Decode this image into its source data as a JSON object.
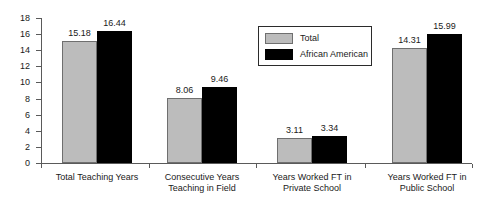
{
  "chart_data": {
    "type": "bar",
    "title": "",
    "xlabel": "",
    "ylabel": "",
    "ylim": [
      0,
      18
    ],
    "ytick_step": 2,
    "grid": false,
    "legend_position": "top-center",
    "categories": [
      "Total Teaching Years",
      "Consecutive Years\nTeaching in Field",
      "Years Worked FT in\nPrivate School",
      "Years Worked FT in\nPublic School"
    ],
    "ytick_labels": [
      "18",
      "16",
      "14",
      "12",
      "10",
      "8",
      "6",
      "4",
      "2",
      "0"
    ],
    "series": [
      {
        "name": "Total",
        "color": "#bcbcbc",
        "values": [
          15.18,
          8.06,
          3.11,
          14.31
        ],
        "value_labels": [
          "15.18",
          "8.06",
          "3.11",
          "14.31"
        ]
      },
      {
        "name": "African American",
        "color": "#000000",
        "values": [
          16.44,
          9.46,
          3.34,
          15.99
        ],
        "value_labels": [
          "16.44",
          "9.46",
          "3.34",
          "15.99"
        ]
      }
    ]
  },
  "legend": {
    "entries": [
      {
        "label": "Total"
      },
      {
        "label": "African American"
      }
    ]
  }
}
